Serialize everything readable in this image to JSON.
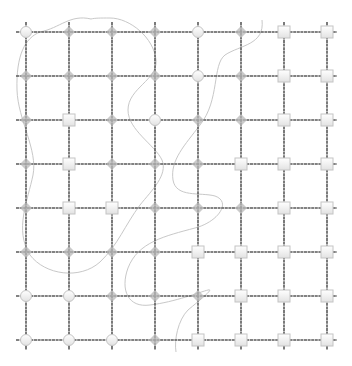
{
  "diagram": {
    "type": "grid-graph",
    "rows": 8,
    "cols": 8,
    "col_x": [
      26,
      69,
      112,
      155,
      198,
      241,
      284,
      327
    ],
    "row_y": [
      32,
      76,
      120,
      164,
      208,
      252,
      296,
      340
    ],
    "line_color": "#5a5a5a",
    "curve_color": "#c8c8c8",
    "node_fill": "#f2f2f2",
    "node_stroke": "#c4c4c4",
    "diamond_fill": "#b8b8b8",
    "legend": {
      "C": "circle",
      "D": "diamond",
      "S": "square"
    },
    "nodes": [
      [
        "C",
        "D",
        "D",
        "D",
        "C",
        "D",
        "S",
        "S"
      ],
      [
        "D",
        "D",
        "D",
        "D",
        "C",
        "D",
        "S",
        "S"
      ],
      [
        "D",
        "S",
        "D",
        "C",
        "D",
        "D",
        "S",
        "S"
      ],
      [
        "D",
        "S",
        "D",
        "D",
        "D",
        "S",
        "S",
        "S"
      ],
      [
        "D",
        "S",
        "S",
        "D",
        "D",
        "D",
        "S",
        "S"
      ],
      [
        "D",
        "D",
        "D",
        "D",
        "S",
        "S",
        "S",
        "S"
      ],
      [
        "C",
        "C",
        "D",
        "D",
        "D",
        "S",
        "S",
        "S"
      ],
      [
        "C",
        "C",
        "C",
        "D",
        "S",
        "S",
        "S",
        "S"
      ]
    ],
    "curves": [
      "M 91 19 C 70 14, 60 28, 40 32 C 25 38, 16 55, 17 90 C 18 120, 38 150, 33 175 C 28 200, 14 230, 30 255 C 45 275, 80 280, 100 262 C 118 245, 125 225, 140 205 C 152 190, 168 175, 162 160 C 155 145, 128 130, 128 110 C 128 88, 158 80, 156 60 C 154 38, 130 18, 110 18 C 100 18, 95 18, 91 19",
      "M 262 20 C 265 45, 240 45, 225 55 C 212 65, 220 100, 200 125 C 185 145, 170 160, 173 180 C 176 198, 200 192, 215 196 C 232 202, 218 222, 195 228 C 165 236, 138 242, 128 268 C 120 290, 128 308, 150 305 C 175 302, 200 292, 208 290 C 215 288, 200 300, 188 310 C 178 320, 174 340, 176 352"
    ]
  }
}
